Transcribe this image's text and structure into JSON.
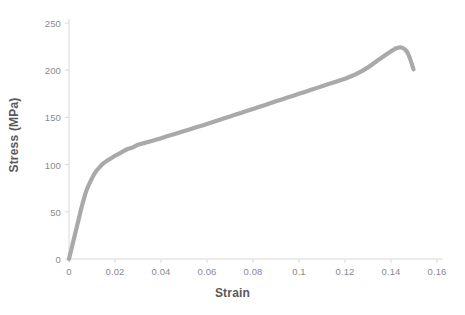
{
  "chart_data": {
    "type": "line",
    "title": "",
    "xlabel": "Strain",
    "ylabel": "Stress (MPa)",
    "xlim": [
      0,
      0.16
    ],
    "ylim": [
      0,
      250
    ],
    "grid": false,
    "legend": null,
    "series_color": "#a9a9a9",
    "line_width_px": 4.2,
    "x_ticks": [
      0,
      0.02,
      0.04,
      0.06,
      0.08,
      0.1,
      0.12,
      0.14,
      0.16
    ],
    "x_tick_labels": [
      "0",
      "0.02",
      "0.04",
      "0.06",
      "0.08",
      "0.1",
      "0.12",
      "0.14",
      "0.16"
    ],
    "y_ticks": [
      0,
      50,
      100,
      150,
      200,
      250
    ],
    "y_tick_labels": [
      "0",
      "50",
      "100",
      "150",
      "200",
      "250"
    ],
    "series": [
      {
        "name": "Stress-Strain",
        "x": [
          0.0,
          0.0006,
          0.0013,
          0.002,
          0.0028,
          0.0036,
          0.0045,
          0.0055,
          0.0065,
          0.0075,
          0.0085,
          0.0095,
          0.0105,
          0.0118,
          0.0132,
          0.0148,
          0.0165,
          0.0185,
          0.0205,
          0.0228,
          0.025,
          0.0275,
          0.03,
          0.033,
          0.036,
          0.04,
          0.044,
          0.048,
          0.052,
          0.056,
          0.06,
          0.065,
          0.07,
          0.075,
          0.08,
          0.085,
          0.09,
          0.095,
          0.1,
          0.105,
          0.11,
          0.115,
          0.12,
          0.125,
          0.13,
          0.134,
          0.137,
          0.14,
          0.142,
          0.1435,
          0.1445,
          0.1455,
          0.1465,
          0.1475,
          0.1483,
          0.149,
          0.1495,
          0.1498
        ],
        "y": [
          0,
          6,
          13,
          20,
          28,
          36,
          45,
          55,
          64,
          72,
          78,
          83,
          88,
          93,
          97,
          101,
          104,
          107,
          110,
          113,
          116,
          118,
          121,
          123,
          125,
          128,
          131,
          134,
          137,
          140,
          143,
          147,
          151,
          155,
          159,
          163,
          167,
          171,
          175,
          179,
          183,
          187,
          191,
          196,
          203,
          210,
          215,
          220,
          223,
          224,
          224,
          223,
          221,
          217,
          212,
          207,
          203,
          201
        ],
        "annotations": {
          "yield_strength_MPa": 95,
          "yield_strain": 0.011,
          "ultimate_tensile_strength_MPa": 224,
          "strain_at_uts": 0.1435,
          "fracture_stress_MPa": 201,
          "fracture_strain": 0.1498
        }
      }
    ]
  },
  "axis_style": {
    "axis_color": "#d9d9d9",
    "tick_color": "#d9d9d9",
    "tick_label_color": "#8a8a8a",
    "axis_title_color": "#595959"
  },
  "plot_geometry": {
    "left_px": 69,
    "right_px": 437,
    "top_px": 23,
    "bottom_px": 259
  }
}
